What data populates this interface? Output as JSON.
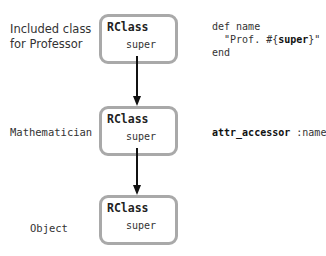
{
  "diagram": {
    "rows": [
      {
        "label_line1": "Included class",
        "label_line2": "for Professor",
        "box": {
          "title": "RClass",
          "field": "super"
        },
        "code": {
          "line1": "def name",
          "line2_prefix": "  \"Prof. #{",
          "line2_bold": "super",
          "line2_suffix": "}\"",
          "line3": "end"
        }
      },
      {
        "label": "Mathematician",
        "box": {
          "title": "RClass",
          "field": "super"
        },
        "code": {
          "bold": "attr_accessor",
          "rest": " :name"
        }
      },
      {
        "label": "Object",
        "box": {
          "title": "RClass",
          "field": "super"
        }
      }
    ],
    "arrows": [
      {
        "from": "row0.super",
        "to": "row1.box"
      },
      {
        "from": "row1.super",
        "to": "row2.box"
      }
    ],
    "colors": {
      "box_border": "#a9a9a9",
      "arrow": "#111111",
      "text": "#333333"
    }
  }
}
